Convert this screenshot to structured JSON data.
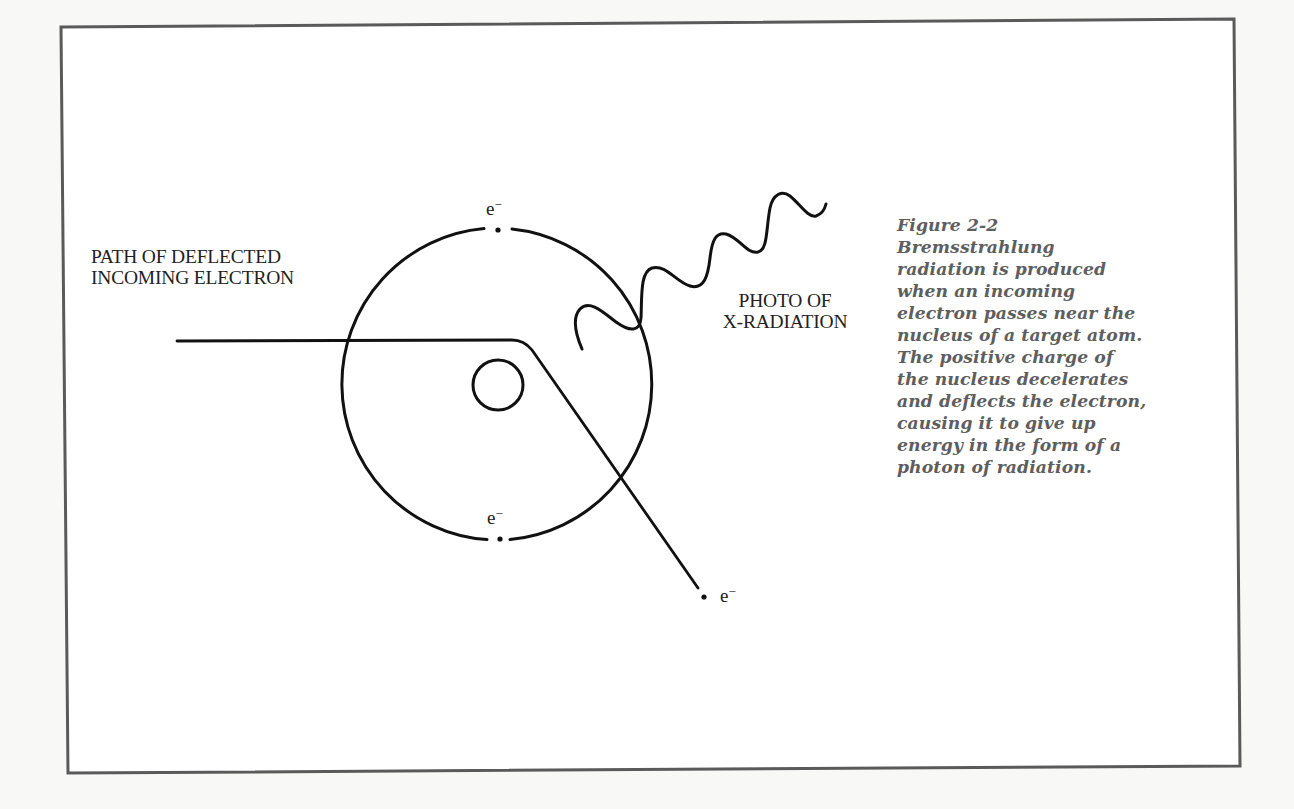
{
  "figure": {
    "frame": {
      "border_color": "#5a5a5a",
      "background": "#ffffff",
      "page_background": "#f8f8f7"
    },
    "labels": {
      "incoming_path": [
        "PATH OF DEFLECTED",
        "INCOMING ELECTRON"
      ],
      "photon": [
        "PHOTO OF",
        "X-RADIATION"
      ],
      "electron_top": {
        "base": "e",
        "sup": "−"
      },
      "electron_bottom": {
        "base": "e",
        "sup": "−"
      },
      "electron_outgoing": {
        "base": "e",
        "sup": "−"
      }
    },
    "caption": {
      "title": "Figure 2-2",
      "lines": [
        "Bremsstrahlung",
        "radiation is produced",
        "when an incoming",
        "electron passes near the",
        "nucleus of a target atom.",
        "The positive charge of",
        "the nucleus decelerates",
        "and deflects the electron,",
        "causing it to give up",
        "energy in the form of a",
        "photon of radiation."
      ],
      "color": "#5e5e5e"
    },
    "geometry": {
      "atom_center": [
        498,
        384
      ],
      "orbit_radius": 156,
      "nucleus_radius": 25,
      "incoming_path_start": [
        177,
        341
      ],
      "bend_point": [
        528,
        346
      ],
      "outgoing_path_end": [
        698,
        588
      ]
    }
  }
}
